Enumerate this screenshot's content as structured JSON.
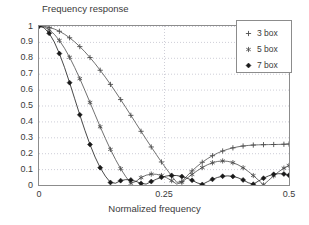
{
  "chart_data": {
    "type": "line",
    "title": "",
    "ylabel": "Frequency response",
    "xlabel": "Normalized frequency",
    "xlim": [
      0,
      0.5
    ],
    "ylim": [
      0,
      1
    ],
    "grid": true,
    "grid_style": "dotted",
    "legend_position": "top-right",
    "xticks": [
      {
        "value": 0,
        "label": "0"
      },
      {
        "value": 0.25,
        "label": "0.25"
      },
      {
        "value": 0.5,
        "label": "0.5"
      }
    ],
    "yticks": [
      {
        "value": 0,
        "label": "0"
      },
      {
        "value": 0.1,
        "label": "0.1"
      },
      {
        "value": 0.2,
        "label": "0.2"
      },
      {
        "value": 0.3,
        "label": "0.3"
      },
      {
        "value": 0.4,
        "label": "0.4"
      },
      {
        "value": 0.5,
        "label": "0.5"
      },
      {
        "value": 0.6,
        "label": "0.6"
      },
      {
        "value": 0.7,
        "label": "0.7"
      },
      {
        "value": 0.8,
        "label": "0.8"
      },
      {
        "value": 0.9,
        "label": "0.9"
      },
      {
        "value": 1,
        "label": "1"
      }
    ],
    "series": [
      {
        "name": "3 box",
        "marker": "plus",
        "color": "#4d4d4d",
        "x": [
          0,
          0.0102,
          0.0204,
          0.0306,
          0.0408,
          0.051,
          0.0612,
          0.0714,
          0.0816,
          0.0918,
          0.102,
          0.1122,
          0.1224,
          0.1327,
          0.1429,
          0.1531,
          0.1633,
          0.1735,
          0.1837,
          0.1939,
          0.2041,
          0.2143,
          0.2245,
          0.2347,
          0.2449,
          0.2551,
          0.2653,
          0.2755,
          0.2857,
          0.2959,
          0.3061,
          0.3163,
          0.3265,
          0.3367,
          0.3469,
          0.3571,
          0.3673,
          0.3776,
          0.3878,
          0.398,
          0.4082,
          0.4184,
          0.4286,
          0.4388,
          0.449,
          0.4592,
          0.4694,
          0.4796,
          0.4898,
          0.5
        ],
        "y": [
          1.0,
          0.9979,
          0.9916,
          0.9812,
          0.9667,
          0.9482,
          0.9259,
          0.8999,
          0.8703,
          0.8375,
          0.8016,
          0.7629,
          0.7216,
          0.6781,
          0.6327,
          0.5856,
          0.5373,
          0.488,
          0.4381,
          0.3879,
          0.3378,
          0.2881,
          0.2392,
          0.1913,
          0.1448,
          0.1,
          0.0571,
          0.0166,
          0.0215,
          0.0568,
          0.0888,
          0.1175,
          0.1429,
          0.1651,
          0.1842,
          0.2004,
          0.2139,
          0.2249,
          0.2336,
          0.2403,
          0.2452,
          0.2488,
          0.2512,
          0.2527,
          0.2536,
          0.2542,
          0.2547,
          0.2553,
          0.2562,
          0.2576
        ]
      },
      {
        "name": "5 box",
        "marker": "star",
        "color": "#4d4d4d",
        "x": [
          0,
          0.0102,
          0.0204,
          0.0306,
          0.0408,
          0.051,
          0.0612,
          0.0714,
          0.0816,
          0.0918,
          0.102,
          0.1122,
          0.1224,
          0.1327,
          0.1429,
          0.1531,
          0.1633,
          0.1735,
          0.1837,
          0.1939,
          0.2041,
          0.2143,
          0.2245,
          0.2347,
          0.2449,
          0.2551,
          0.2653,
          0.2755,
          0.2857,
          0.2959,
          0.3061,
          0.3163,
          0.3265,
          0.3367,
          0.3469,
          0.3571,
          0.3673,
          0.3776,
          0.3878,
          0.398,
          0.4082,
          0.4184,
          0.4286,
          0.4388,
          0.449,
          0.4592,
          0.4694,
          0.4796,
          0.4898,
          0.5
        ],
        "y": [
          1.0,
          0.9941,
          0.9766,
          0.948,
          0.9089,
          0.8602,
          0.8031,
          0.7388,
          0.669,
          0.5951,
          0.5189,
          0.4421,
          0.3663,
          0.2931,
          0.2239,
          0.16,
          0.1026,
          0.0526,
          0.0108,
          0.0223,
          0.0465,
          0.0617,
          0.0685,
          0.0674,
          0.0595,
          0.0457,
          0.0273,
          0.0056,
          0.018,
          0.0424,
          0.0665,
          0.0893,
          0.1097,
          0.1269,
          0.1399,
          0.1482,
          0.1512,
          0.1487,
          0.1406,
          0.1271,
          0.1086,
          0.0858,
          0.0595,
          0.0308,
          0.0009,
          0.0291,
          0.0577,
          0.0839,
          0.1059,
          0.1226
        ]
      },
      {
        "name": "7 box",
        "marker": "diamond",
        "color": "#1a1a1a",
        "x": [
          0,
          0.0102,
          0.0204,
          0.0306,
          0.0408,
          0.051,
          0.0612,
          0.0714,
          0.0816,
          0.0918,
          0.102,
          0.1122,
          0.1224,
          0.1327,
          0.1429,
          0.1531,
          0.1633,
          0.1735,
          0.1837,
          0.1939,
          0.2041,
          0.2143,
          0.2245,
          0.2347,
          0.2449,
          0.2551,
          0.2653,
          0.2755,
          0.2857,
          0.2959,
          0.3061,
          0.3163,
          0.3265,
          0.3367,
          0.3469,
          0.3571,
          0.3673,
          0.3776,
          0.3878,
          0.398,
          0.4082,
          0.4184,
          0.4286,
          0.4388,
          0.449,
          0.4592,
          0.4694,
          0.4796,
          0.4898,
          0.5
        ],
        "y": [
          1.0,
          0.9884,
          0.9541,
          0.8991,
          0.8264,
          0.7397,
          0.6435,
          0.5424,
          0.4411,
          0.3439,
          0.2544,
          0.1754,
          0.1089,
          0.0557,
          0.0159,
          0.0114,
          0.0275,
          0.0338,
          0.0317,
          0.023,
          0.0098,
          0.0057,
          0.0216,
          0.0363,
          0.0484,
          0.0567,
          0.0605,
          0.0594,
          0.0535,
          0.0433,
          0.0296,
          0.0135,
          0.0035,
          0.0203,
          0.0355,
          0.0476,
          0.0552,
          0.0575,
          0.0542,
          0.0454,
          0.0318,
          0.0145,
          0.005,
          0.0247,
          0.0427,
          0.0573,
          0.0672,
          0.0713,
          0.0693,
          0.0614
        ]
      }
    ],
    "note": "Magnitude response of N-point moving-average (box) filters; plotted y is |sin(pi N f)/(N sin(pi f))| scaled so DC = 1 and endpoint values approach 1/3, 1/5, 1/7."
  },
  "legend": {
    "entries": [
      {
        "label": "3 box",
        "marker": "plus"
      },
      {
        "label": "5 box",
        "marker": "star"
      },
      {
        "label": "7 box",
        "marker": "diamond"
      }
    ]
  },
  "axes": {
    "ylabel": "Frequency response",
    "xlabel": "Normalized frequency"
  },
  "colors": {
    "background": "#ffffff",
    "axis": "#8c8c8c",
    "grid": "#b9b9c6",
    "text": "#3a3a3a",
    "series_light": "#4d4d4d",
    "series_dark": "#1a1a1a"
  }
}
